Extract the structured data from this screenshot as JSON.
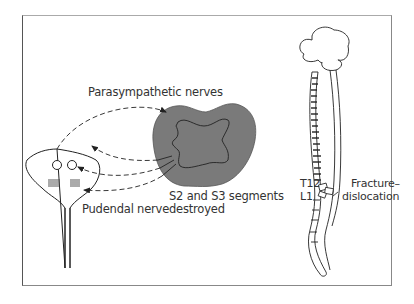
{
  "diagram": {
    "type": "medical-illustration",
    "labels": {
      "parasympathetic": "Parasympathetic nerves",
      "pudendal": "Pudendal nerve",
      "segments_line1": "S2 and S3 segments",
      "segments_line2": "destroyed",
      "t12": "T12",
      "l1": "L1",
      "fracture_line1": "Fracture–",
      "fracture_line2": "dislocation"
    },
    "components": [
      "bladder-with-urethra-and-sphincters",
      "spinal-cord-cross-section",
      "brain-and-spinal-column"
    ],
    "colors": {
      "cord_fill": "#7a7a7a",
      "stroke": "#222222",
      "frame": "#888888"
    }
  }
}
